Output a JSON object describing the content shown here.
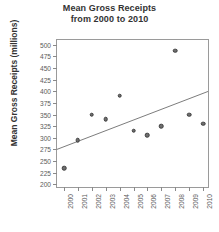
{
  "chart": {
    "title_line1": "Mean Gross Receipts",
    "title_line2": "from 2000 to 2010",
    "ylabel": "Mean Gross Receipts (millions)",
    "xlabel": ""
  },
  "chart_data": {
    "type": "scatter",
    "title": "Mean Gross Receipts from 2000 to 2010",
    "xlabel": "",
    "ylabel": "Mean Gross Receipts (millions)",
    "x": [
      2000,
      2001,
      2002,
      2003,
      2004,
      2005,
      2006,
      2007,
      2008,
      2009,
      2010
    ],
    "values": [
      235,
      295,
      350,
      340,
      390,
      315,
      305,
      325,
      487,
      350,
      330
    ],
    "categories": [
      "2000",
      "2001",
      "2002",
      "2003",
      "2004",
      "2005",
      "2006",
      "2007",
      "2008",
      "2009",
      "2010"
    ],
    "xtick_labels": [
      "2000",
      "2001",
      "2002",
      "2003",
      "2004",
      "2005",
      "2006",
      "2007",
      "2008",
      "2009",
      "2010"
    ],
    "ytick_labels": [
      "200",
      "225",
      "250",
      "275",
      "300",
      "325",
      "350",
      "375",
      "400",
      "425",
      "450",
      "475",
      "500"
    ],
    "ytick_values": [
      200,
      225,
      250,
      275,
      300,
      325,
      350,
      375,
      400,
      425,
      450,
      475,
      500
    ],
    "ylim": [
      190,
      510
    ],
    "xlim": [
      1999.5,
      2010.5
    ],
    "grid": false,
    "legend": false,
    "marker_color": "#6f6f6f",
    "marker_edge_color": "#3d3d3d",
    "trendline": {
      "show": true,
      "color": "#7a7a7a",
      "x_start": 1999.5,
      "y_start": 272,
      "x_end": 2010.5,
      "y_end": 398
    }
  }
}
